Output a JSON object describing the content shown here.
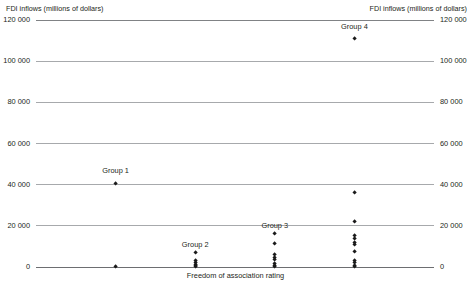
{
  "chart_data": {
    "type": "scatter",
    "title": "",
    "ylabel": "FDI inflows (millions of dollars)",
    "ylabel_right": "FDI inflows (millions of dollars)",
    "xlabel": "Freedom of association rating",
    "ylim": [
      0,
      120000
    ],
    "ytick_values": [
      0,
      20000,
      40000,
      60000,
      80000,
      100000,
      120000
    ],
    "ytick_labels": [
      "0",
      "20 000",
      "40 000",
      "60 000",
      "80 000",
      "100 000",
      "120 000"
    ],
    "grid": true,
    "legend": "none",
    "xlim": [
      0,
      5
    ],
    "xtick_labels": [],
    "series": [
      {
        "name": "Group 1",
        "x": 1,
        "label_y": 46500,
        "values": [
          40500,
          0
        ]
      },
      {
        "name": "Group 2",
        "x": 2,
        "label_y": 10500,
        "values": [
          7000,
          3200,
          2100,
          1300,
          600,
          0
        ]
      },
      {
        "name": "Group 3",
        "x": 3,
        "label_y": 20000,
        "values": [
          16200,
          11200,
          6000,
          4700,
          3400,
          1600,
          700,
          0
        ]
      },
      {
        "name": "Group 4",
        "x": 4,
        "label_y": 116500,
        "values": [
          111000,
          36000,
          22000,
          15300,
          13600,
          12100,
          10700,
          7500,
          3300,
          2000,
          900,
          0
        ]
      }
    ]
  }
}
